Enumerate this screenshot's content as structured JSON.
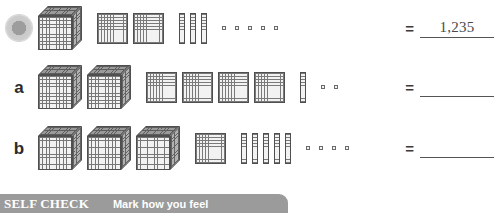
{
  "worksheet": {
    "rows": [
      {
        "id": "example",
        "marker_type": "bullet-dot",
        "label": "",
        "blocks": {
          "cubes": 1,
          "flats": 2,
          "rods": 3,
          "units": 5
        },
        "equals": "=",
        "answer": "1,235"
      },
      {
        "id": "a",
        "marker_type": "letter",
        "label": "a",
        "blocks": {
          "cubes": 2,
          "flats": 4,
          "rods": 1,
          "units": 2
        },
        "equals": "=",
        "answer": ""
      },
      {
        "id": "b",
        "marker_type": "letter",
        "label": "b",
        "blocks": {
          "cubes": 3,
          "flats": 1,
          "rods": 5,
          "units": 4
        },
        "equals": "=",
        "answer": ""
      }
    ]
  },
  "self_check": {
    "title": "SELF CHECK",
    "subtitle": "Mark how you feel",
    "bar_color": "#9b9b9b",
    "text_color": "#ffffff"
  }
}
